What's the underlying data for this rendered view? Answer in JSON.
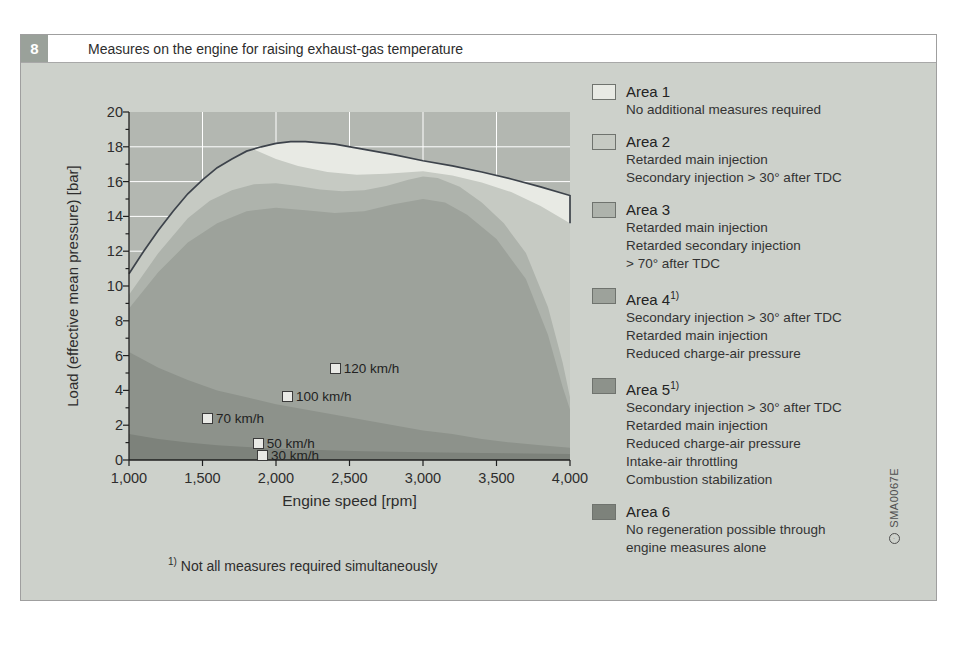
{
  "figure": {
    "number": "8",
    "title": "Measures on the engine for raising exhaust-gas temperature",
    "footnote_marker": "1)",
    "footnote": "Not all measures required simultaneously",
    "watermark": "SMA0067E"
  },
  "colors": {
    "panel_bg": "#cdd1cb",
    "header_badge_bg": "#9aa19a",
    "plot_bg": "#b3b7b1",
    "grid": "#ffffff",
    "curve": "#3d434b",
    "spine": "#1f1f1f",
    "marker_fill": "#e9eae6",
    "area1": "#e8eae4",
    "area2": "#c6cac3",
    "area3": "#aeb3ac",
    "area4": "#9da29b",
    "area5": "#8d928b",
    "area6": "#7d827b"
  },
  "chart_data": {
    "type": "area",
    "xlabel": "Engine speed [rpm]",
    "ylabel": "Load (effective mean pressure) [bar]",
    "xlim": [
      1000,
      4000
    ],
    "ylim": [
      0,
      20
    ],
    "grid": true,
    "x_ticks": [
      1000,
      1500,
      2000,
      2500,
      3000,
      3500,
      4000
    ],
    "x_tick_labels": [
      "1,000",
      "1,500",
      "2,000",
      "2,500",
      "3,000",
      "3,500",
      "4,000"
    ],
    "y_ticks": [
      0,
      2,
      4,
      6,
      8,
      10,
      12,
      14,
      16,
      18,
      20
    ],
    "full_load_curve": [
      [
        1000,
        10.7
      ],
      [
        1100,
        12.0
      ],
      [
        1200,
        13.2
      ],
      [
        1300,
        14.3
      ],
      [
        1400,
        15.3
      ],
      [
        1500,
        16.1
      ],
      [
        1600,
        16.8
      ],
      [
        1700,
        17.3
      ],
      [
        1800,
        17.75
      ],
      [
        1900,
        18.0
      ],
      [
        2000,
        18.2
      ],
      [
        2100,
        18.3
      ],
      [
        2200,
        18.3
      ],
      [
        2400,
        18.15
      ],
      [
        2600,
        17.85
      ],
      [
        2800,
        17.55
      ],
      [
        3000,
        17.2
      ],
      [
        3200,
        16.9
      ],
      [
        3400,
        16.55
      ],
      [
        3600,
        16.15
      ],
      [
        3800,
        15.7
      ],
      [
        4000,
        15.2
      ]
    ],
    "curve_end_drop": [
      [
        4000,
        15.2
      ],
      [
        4000,
        13.6
      ]
    ],
    "area1_bottom": [
      [
        1850,
        17.85
      ],
      [
        2000,
        17.3
      ],
      [
        2150,
        16.9
      ],
      [
        2350,
        16.55
      ],
      [
        2550,
        16.4
      ],
      [
        2750,
        16.45
      ],
      [
        3000,
        16.6
      ],
      [
        3200,
        16.35
      ],
      [
        3400,
        15.95
      ],
      [
        3600,
        15.4
      ],
      [
        3800,
        14.6
      ],
      [
        4000,
        13.6
      ]
    ],
    "area2_bottom": [
      [
        1000,
        9.5
      ],
      [
        1200,
        11.9
      ],
      [
        1400,
        13.9
      ],
      [
        1550,
        14.9
      ],
      [
        1700,
        15.5
      ],
      [
        1850,
        15.85
      ],
      [
        2000,
        15.9
      ],
      [
        2150,
        15.75
      ],
      [
        2300,
        15.55
      ],
      [
        2450,
        15.45
      ],
      [
        2600,
        15.5
      ],
      [
        2750,
        15.75
      ],
      [
        2900,
        16.1
      ],
      [
        3000,
        16.3
      ],
      [
        3100,
        16.2
      ],
      [
        3250,
        15.7
      ],
      [
        3400,
        14.8
      ],
      [
        3550,
        13.6
      ],
      [
        3700,
        11.9
      ],
      [
        3850,
        8.8
      ],
      [
        3950,
        5.6
      ],
      [
        4000,
        3.6
      ]
    ],
    "area3_bottom": [
      [
        1000,
        8.7
      ],
      [
        1200,
        10.8
      ],
      [
        1400,
        12.5
      ],
      [
        1600,
        13.6
      ],
      [
        1800,
        14.3
      ],
      [
        2000,
        14.5
      ],
      [
        2200,
        14.35
      ],
      [
        2400,
        14.2
      ],
      [
        2600,
        14.3
      ],
      [
        2800,
        14.7
      ],
      [
        3000,
        15.0
      ],
      [
        3150,
        14.8
      ],
      [
        3300,
        14.1
      ],
      [
        3500,
        12.7
      ],
      [
        3700,
        10.4
      ],
      [
        3850,
        7.2
      ],
      [
        3950,
        4.2
      ],
      [
        4000,
        2.9
      ]
    ],
    "area4_bottom": [
      [
        1000,
        6.2
      ],
      [
        1200,
        5.3
      ],
      [
        1400,
        4.6
      ],
      [
        1600,
        4.0
      ],
      [
        1800,
        3.6
      ],
      [
        2000,
        3.2
      ],
      [
        2200,
        2.9
      ],
      [
        2400,
        2.6
      ],
      [
        2600,
        2.3
      ],
      [
        2800,
        2.0
      ],
      [
        3000,
        1.7
      ],
      [
        3200,
        1.5
      ],
      [
        3400,
        1.2
      ],
      [
        3600,
        1.0
      ],
      [
        3800,
        0.85
      ],
      [
        4000,
        0.7
      ]
    ],
    "area5_bottom": [
      [
        1000,
        1.5
      ],
      [
        1200,
        1.2
      ],
      [
        1400,
        1.0
      ],
      [
        1600,
        0.85
      ],
      [
        1800,
        0.75
      ],
      [
        2000,
        0.65
      ],
      [
        2200,
        0.6
      ],
      [
        2400,
        0.55
      ],
      [
        2600,
        0.5
      ],
      [
        2800,
        0.47
      ],
      [
        3000,
        0.45
      ],
      [
        3400,
        0.4
      ],
      [
        4000,
        0.35
      ]
    ],
    "speed_markers": [
      {
        "label": "120 km/h",
        "rpm": 2400,
        "bar": 5.3
      },
      {
        "label": "100 km/h",
        "rpm": 2075,
        "bar": 3.7
      },
      {
        "label": "70 km/h",
        "rpm": 1530,
        "bar": 2.4
      },
      {
        "label": "50 km/h",
        "rpm": 1875,
        "bar": 0.95
      },
      {
        "label": "30 km/h",
        "rpm": 1905,
        "bar": 0.3
      }
    ]
  },
  "legend": {
    "items": [
      {
        "label": "Area 1",
        "sup": "",
        "color": "#e8eae4",
        "lines": [
          "No additional measures required"
        ]
      },
      {
        "label": "Area 2",
        "sup": "",
        "color": "#c6cac3",
        "lines": [
          "Retarded main injection",
          "Secondary injection > 30° after TDC"
        ]
      },
      {
        "label": "Area 3",
        "sup": "",
        "color": "#aeb3ac",
        "lines": [
          "Retarded main injection",
          "Retarded secondary injection",
          "> 70° after TDC"
        ]
      },
      {
        "label": "Area 4",
        "sup": "1)",
        "color": "#9da29b",
        "lines": [
          "Secondary injection > 30° after TDC",
          "Retarded main injection",
          "Reduced charge-air pressure"
        ]
      },
      {
        "label": "Area 5",
        "sup": "1)",
        "color": "#8d928b",
        "lines": [
          "Secondary injection > 30° after TDC",
          "Retarded main injection",
          "Reduced charge-air pressure",
          "Intake-air throttling",
          "Combustion stabilization"
        ]
      },
      {
        "label": "Area 6",
        "sup": "",
        "color": "#7d827b",
        "lines": [
          "No regeneration possible through",
          "engine measures alone"
        ]
      }
    ]
  }
}
